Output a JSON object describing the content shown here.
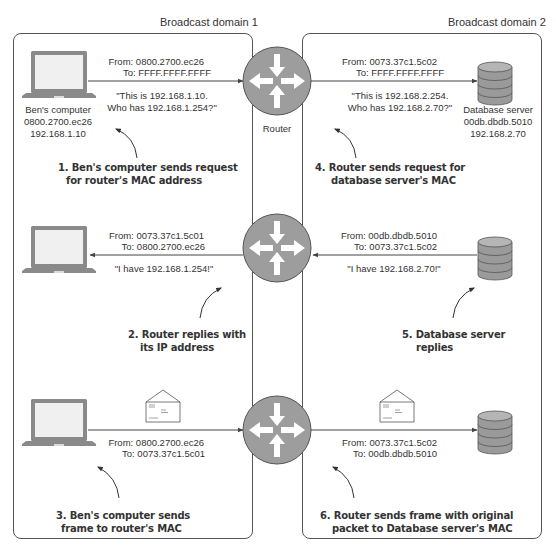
{
  "domains": [
    {
      "title": "Broadcast domain 1"
    },
    {
      "title": "Broadcast domain 2"
    }
  ],
  "router_label": "Router",
  "computer": {
    "name": "Ben's computer",
    "mac": "0800.2700.ec26",
    "ip": "192.168.1.10"
  },
  "database": {
    "name": "Database server",
    "mac": "00db.dbdb.5010",
    "ip": "192.168.2.70"
  },
  "rows": [
    {
      "left": {
        "from": "From: 0800.2700.ec26",
        "to": "To: FFFF.FFFF.FFFF",
        "message_line1": "\"This is 192.168.1.10.",
        "message_line2": "Who has 192.168.1.254?\"",
        "step_line1": "1. Ben's computer sends request",
        "step_line2": "for router's MAC address",
        "direction": "to-router"
      },
      "right": {
        "from": "From: 0073.37c1.5c02",
        "to": "To: FFFF.FFFF.FFFF",
        "message_line1": "\"This is 192.168.2.254.",
        "message_line2": "Who has 192.168.2.70?\"",
        "step_line1": "4. Router sends request for",
        "step_line2": "database server's MAC",
        "direction": "to-database"
      }
    },
    {
      "left": {
        "from": "From: 0073.37c1.5c01",
        "to": "To: 0800.2700.ec26",
        "message_line1": "\"I have 192.168.1.254!\"",
        "step_line1": "2. Router replies with",
        "step_line2": "its IP address",
        "direction": "to-computer"
      },
      "right": {
        "from": "From: 00db.dbdb.5010",
        "to": "To: 0073.37c1.5c02",
        "message_line1": "\"I have 192.168.2.70!\"",
        "step_line1": "5. Database server",
        "step_line2": "replies",
        "direction": "to-router"
      }
    },
    {
      "left": {
        "from": "From: 0800.2700.ec26",
        "to": "To: 0073.37c1.5c01",
        "step_line1": "3. Ben's computer sends",
        "step_line2": "frame to router's MAC",
        "direction": "to-router",
        "payload_icon": "envelope-icon"
      },
      "right": {
        "from": "From: 0073.37c1.5c02",
        "to": "To: 00db.dbdb.5010",
        "step_line1": "6. Router sends frame with original",
        "step_line2": "packet to Database server's MAC",
        "direction": "to-database",
        "payload_icon": "envelope-icon"
      }
    }
  ],
  "colors": {
    "router_fill": "#9d9d9d",
    "router_stroke": "#555555",
    "line": "#444444",
    "device_gray": "#8a8a8a",
    "screen": "#eeeeee"
  }
}
